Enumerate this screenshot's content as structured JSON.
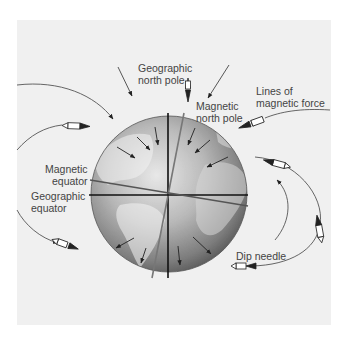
{
  "diagram": {
    "type": "earth-magnetic-field",
    "labels": {
      "geographic_north_pole": "Geographic\nnorth pole",
      "magnetic_north_pole": "Magnetic\nnorth pole",
      "lines_of_magnetic_force": "Lines of\nmagnetic force",
      "magnetic_equator": "Magnetic\nequator",
      "geographic_equator": "Geographic\nequator",
      "dip_needle": "Dip needle"
    },
    "colors": {
      "panel_bg": "#f0f0f0",
      "text": "#444444",
      "geographic_axis": "#111111",
      "magnetic_axis": "#777777",
      "field_lines": "#555555"
    },
    "icons": [
      "compass-needle-icon",
      "arrow-icon",
      "globe-icon"
    ]
  }
}
